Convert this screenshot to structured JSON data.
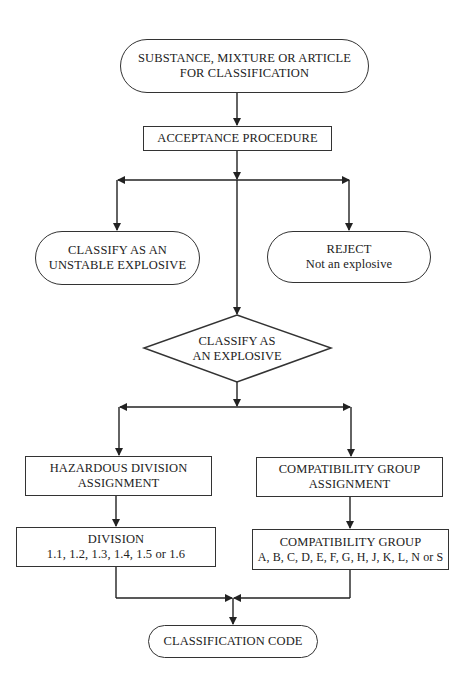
{
  "diagram": {
    "type": "flowchart",
    "nodes": {
      "start": {
        "shape": "terminator",
        "line1": "SUBSTANCE, MIXTURE OR ARTICLE",
        "line2": "FOR CLASSIFICATION"
      },
      "acceptance": {
        "shape": "process",
        "label": "ACCEPTANCE PROCEDURE"
      },
      "unstable": {
        "shape": "terminator",
        "line1": "CLASSIFY AS AN",
        "line2": "UNSTABLE EXPLOSIVE"
      },
      "reject": {
        "shape": "terminator",
        "line1": "REJECT",
        "line2": "Not an explosive"
      },
      "classify": {
        "shape": "decision",
        "line1": "CLASSIFY AS",
        "line2": "AN EXPLOSIVE"
      },
      "hazard_assign": {
        "shape": "process",
        "line1": "HAZARDOUS DIVISION",
        "line2": "ASSIGNMENT"
      },
      "compat_assign": {
        "shape": "process",
        "line1": "COMPATIBILITY GROUP",
        "line2": "ASSIGNMENT"
      },
      "division": {
        "shape": "process",
        "line1": "DIVISION",
        "line2": "1.1, 1.2, 1.3, 1.4, 1.5 or 1.6"
      },
      "compat_group": {
        "shape": "process",
        "line1": "COMPATIBILITY GROUP",
        "line2": "A, B, C, D, E, F, G, H, J, K, L, N or S"
      },
      "code": {
        "shape": "terminator",
        "label": "CLASSIFICATION CODE"
      }
    },
    "edges": [
      [
        "start",
        "acceptance"
      ],
      [
        "acceptance",
        "unstable"
      ],
      [
        "acceptance",
        "reject"
      ],
      [
        "acceptance",
        "classify"
      ],
      [
        "classify",
        "hazard_assign"
      ],
      [
        "classify",
        "compat_assign"
      ],
      [
        "hazard_assign",
        "division"
      ],
      [
        "compat_assign",
        "compat_group"
      ],
      [
        "division",
        "code"
      ],
      [
        "compat_group",
        "code"
      ]
    ]
  }
}
